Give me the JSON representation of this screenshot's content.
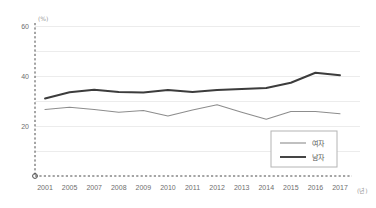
{
  "chart_data": {
    "type": "line",
    "title": "",
    "subtitle": "",
    "xlabel": "",
    "ylabel": "",
    "x_unit": "(년)",
    "y_unit": "(%)",
    "grid": true,
    "legend_position": "bottom-right",
    "categories": [
      "2001",
      "2005",
      "2007",
      "2008",
      "2009",
      "2010",
      "2011",
      "2012",
      "2013",
      "2014",
      "2015",
      "2016",
      "2017"
    ],
    "ylim": [
      0,
      60
    ],
    "yticks": [
      20,
      40,
      60
    ],
    "ytick_labels": [
      "20",
      "40",
      "60"
    ],
    "gridline_values": [
      10,
      20,
      30,
      40,
      50,
      60
    ],
    "origin_label": "O",
    "series": [
      {
        "name": "여자",
        "style": "thin",
        "color": "#8d8d8d",
        "values": [
          26.6,
          27.5,
          26.6,
          25.5,
          26.2,
          24.0,
          26.4,
          28.5,
          25.5,
          22.7,
          25.8,
          25.8,
          24.9
        ]
      },
      {
        "name": "남자",
        "style": "thick",
        "color": "#3c3c3c",
        "values": [
          31.0,
          33.5,
          34.5,
          33.6,
          33.4,
          34.4,
          33.6,
          34.4,
          34.8,
          35.2,
          37.3,
          41.3,
          40.3
        ]
      }
    ],
    "legend_entries": [
      {
        "label": "여자",
        "color": "#8d8d8d",
        "style": "thin"
      },
      {
        "label": "남자",
        "color": "#3c3c3c",
        "style": "thick"
      }
    ]
  }
}
